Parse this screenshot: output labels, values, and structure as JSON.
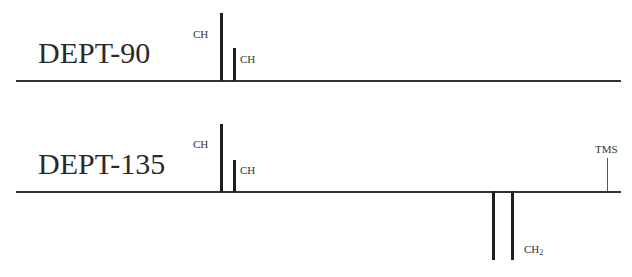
{
  "spectra": [
    {
      "title": "DEPT-90",
      "peaks": [
        {
          "label": "CH",
          "direction": "up",
          "relative_height": 1.0
        },
        {
          "label": "CH",
          "direction": "up",
          "relative_height": 0.48
        }
      ]
    },
    {
      "title": "DEPT-135",
      "peaks": [
        {
          "label": "CH",
          "direction": "up",
          "relative_height": 1.0
        },
        {
          "label": "CH",
          "direction": "up",
          "relative_height": 0.47
        },
        {
          "label": "CH2",
          "direction": "down",
          "relative_height": 1.0
        },
        {
          "label": "CH2",
          "direction": "down",
          "relative_height": 1.0
        }
      ],
      "reference": {
        "label": "TMS"
      }
    }
  ],
  "labels": {
    "dept90_title": "DEPT-90",
    "dept90_ch_1": "CH",
    "dept90_ch_2": "CH",
    "dept135_title": "DEPT-135",
    "dept135_ch_1": "CH",
    "dept135_ch_2": "CH",
    "dept135_ch2_main": "CH",
    "dept135_ch2_sub": "2",
    "tms": "TMS"
  }
}
